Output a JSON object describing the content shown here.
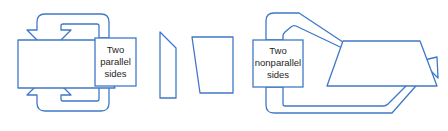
{
  "canvas": {
    "width": 448,
    "height": 131,
    "background": "#ffffff"
  },
  "style": {
    "stroke": "#3F78C8",
    "stroke_width": 1.3,
    "shape_fill": "#ffffff",
    "text_color": "#262626",
    "box_border": "#3F78C8"
  },
  "labels": {
    "parallel": {
      "line1": "Two",
      "line2": "parallel",
      "line3": "sides"
    },
    "nonparallel": {
      "line1": "Two",
      "line2": "nonparallel",
      "line3": "sides"
    }
  },
  "shapes": {
    "left_trapezoid": {
      "name": "right-trapezoid-parallel-sides",
      "points": "18,40 95,40 115,88 18,88"
    },
    "middle_sliver": {
      "name": "narrow-quadrilateral",
      "points": "160,32 176,48 176,98 160,98"
    },
    "middle_trapezoid": {
      "name": "trapezoid-vertical-right-side",
      "points": "192,37 233,37 233,93 200,93"
    },
    "right_trapezoid": {
      "name": "trapezoid-nonparallel-sides",
      "points": "343,41 420,41 437,86 327,86"
    }
  },
  "label_boxes": {
    "parallel_box": {
      "x": 95,
      "y": 38,
      "width": 41,
      "height": 48
    },
    "nonparallel_box": {
      "x": 253,
      "y": 40,
      "width": 50,
      "height": 47
    }
  },
  "arrows": [
    {
      "name": "arrow-to-top-parallel-side",
      "direction": "down",
      "target": "top edge of left trapezoid"
    },
    {
      "name": "arrow-to-bottom-parallel-side",
      "direction": "up",
      "target": "bottom edge of left trapezoid"
    },
    {
      "name": "arrow-to-left-nonparallel-side",
      "direction": "down-right",
      "target": "left slanted side of right trapezoid"
    },
    {
      "name": "arrow-to-right-nonparallel-side",
      "direction": "up-right",
      "target": "right slanted side of right trapezoid"
    }
  ]
}
